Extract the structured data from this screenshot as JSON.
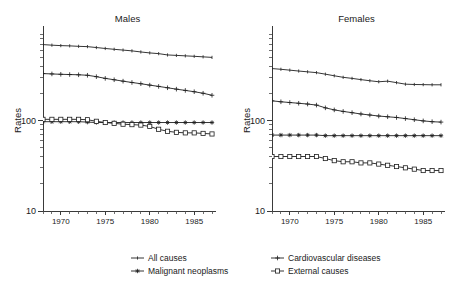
{
  "figure": {
    "ylabel": "Rates",
    "panels": [
      {
        "key": "males",
        "title": "Males"
      },
      {
        "key": "females",
        "title": "Females"
      }
    ]
  },
  "legend": {
    "items": [
      {
        "label": "All causes",
        "marker": "line-dash"
      },
      {
        "label": "Cardiovascular diseases",
        "marker": "plus"
      },
      {
        "label": "Malignant neoplasms",
        "marker": "star"
      },
      {
        "label": "External causes",
        "marker": "square"
      }
    ]
  },
  "chart_data": {
    "type": "line",
    "title": "",
    "subtitle": "",
    "xlabel": "",
    "ylabel": "Rates",
    "yscale": "log",
    "ylim": [
      10,
      1000
    ],
    "yticks": [
      10,
      100
    ],
    "yticklabels": [
      "10",
      "100"
    ],
    "xlim": [
      1968,
      1987
    ],
    "xticks": [
      1970,
      1975,
      1980,
      1985
    ],
    "xticklabels": [
      "1970",
      "1975",
      "1980",
      "1985"
    ],
    "grid": false,
    "legend_position": "bottom",
    "x": [
      1968,
      1969,
      1970,
      1971,
      1972,
      1973,
      1974,
      1975,
      1976,
      1977,
      1978,
      1979,
      1980,
      1981,
      1982,
      1983,
      1984,
      1985,
      1986,
      1987
    ],
    "panels": [
      {
        "name": "Males",
        "series": [
          {
            "name": "All causes",
            "marker": "line-dash",
            "values": [
              690,
              680,
              672,
              668,
              660,
              655,
              640,
              625,
              612,
              600,
              588,
              572,
              558,
              548,
              530,
              524,
              518,
              512,
              505,
              498
            ]
          },
          {
            "name": "Cardiovascular diseases",
            "marker": "plus",
            "values": [
              330,
              327,
              324,
              322,
              320,
              316,
              305,
              292,
              282,
              272,
              263,
              255,
              246,
              238,
              230,
              222,
              215,
              208,
              200,
              190
            ]
          },
          {
            "name": "Malignant neoplasms",
            "marker": "star",
            "values": [
              97,
              97,
              97,
              97,
              97,
              96,
              95,
              95,
              95,
              95,
              95,
              95,
              95,
              95,
              95,
              95,
              95,
              95,
              95,
              95
            ]
          },
          {
            "name": "External causes",
            "marker": "square",
            "values": [
              103,
              103,
              103,
              103,
              103,
              102,
              98,
              95,
              93,
              91,
              90,
              89,
              86,
              80,
              76,
              74,
              73,
              73,
              72,
              71
            ]
          }
        ]
      },
      {
        "name": "Females",
        "series": [
          {
            "name": "All causes",
            "marker": "line-dash",
            "values": [
              375,
              368,
              360,
              352,
              345,
              338,
              325,
              312,
              300,
              292,
              283,
              275,
              268,
              272,
              262,
              252,
              250,
              249,
              248,
              248
            ]
          },
          {
            "name": "Cardiovascular diseases",
            "marker": "plus",
            "values": [
              165,
              161,
              158,
              155,
              152,
              148,
              138,
              131,
              126,
              122,
              118,
              115,
              112,
              110,
              108,
              105,
              102,
              99,
              97,
              96
            ]
          },
          {
            "name": "Malignant neoplasms",
            "marker": "star",
            "values": [
              69,
              69,
              69,
              69,
              69,
              69,
              68,
              68,
              68,
              68,
              68,
              68,
              68,
              68,
              68,
              68,
              68,
              68,
              68,
              68
            ]
          },
          {
            "name": "External causes",
            "marker": "square",
            "values": [
              40,
              40,
              40,
              40,
              40,
              40,
              38,
              36,
              35,
              35,
              34,
              34,
              33,
              32,
              31,
              30,
              29,
              28,
              28,
              28
            ]
          }
        ]
      }
    ]
  }
}
